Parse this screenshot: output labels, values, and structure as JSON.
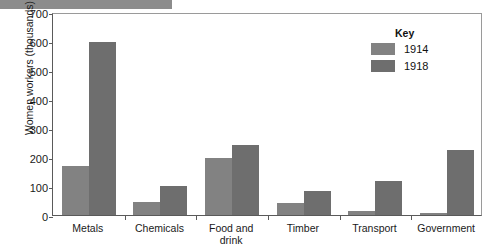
{
  "chart_data": {
    "type": "bar",
    "title": "",
    "xlabel": "",
    "ylabel": "Women workers (thousands)",
    "ylim": [
      0,
      700
    ],
    "yticks": [
      0,
      100,
      200,
      300,
      400,
      500,
      600,
      700
    ],
    "grid": false,
    "legend_position": "top-right",
    "legend_title": "Key",
    "categories": [
      "Metals",
      "Chemicals",
      "Food and drink",
      "Timber",
      "Transport",
      "Government"
    ],
    "series": [
      {
        "name": "1914",
        "color": "#828282",
        "values": [
          170,
          45,
          195,
          40,
          15,
          8
        ]
      },
      {
        "name": "1918",
        "color": "#6e6e6e",
        "values": [
          595,
          100,
          240,
          82,
          118,
          225
        ]
      }
    ]
  },
  "axis": {
    "y_title": "Women workers (thousands)",
    "y_ticks": [
      "700",
      "600",
      "500",
      "400",
      "300",
      "200",
      "100",
      "0"
    ],
    "x_labels": [
      "Metals",
      "Chemicals",
      "Food and\ndrink",
      "Timber",
      "Transport",
      "Government"
    ]
  },
  "legend": {
    "title": "Key",
    "entries": [
      {
        "label": "1914",
        "color": "#828282"
      },
      {
        "label": "1918",
        "color": "#6e6e6e"
      }
    ]
  }
}
